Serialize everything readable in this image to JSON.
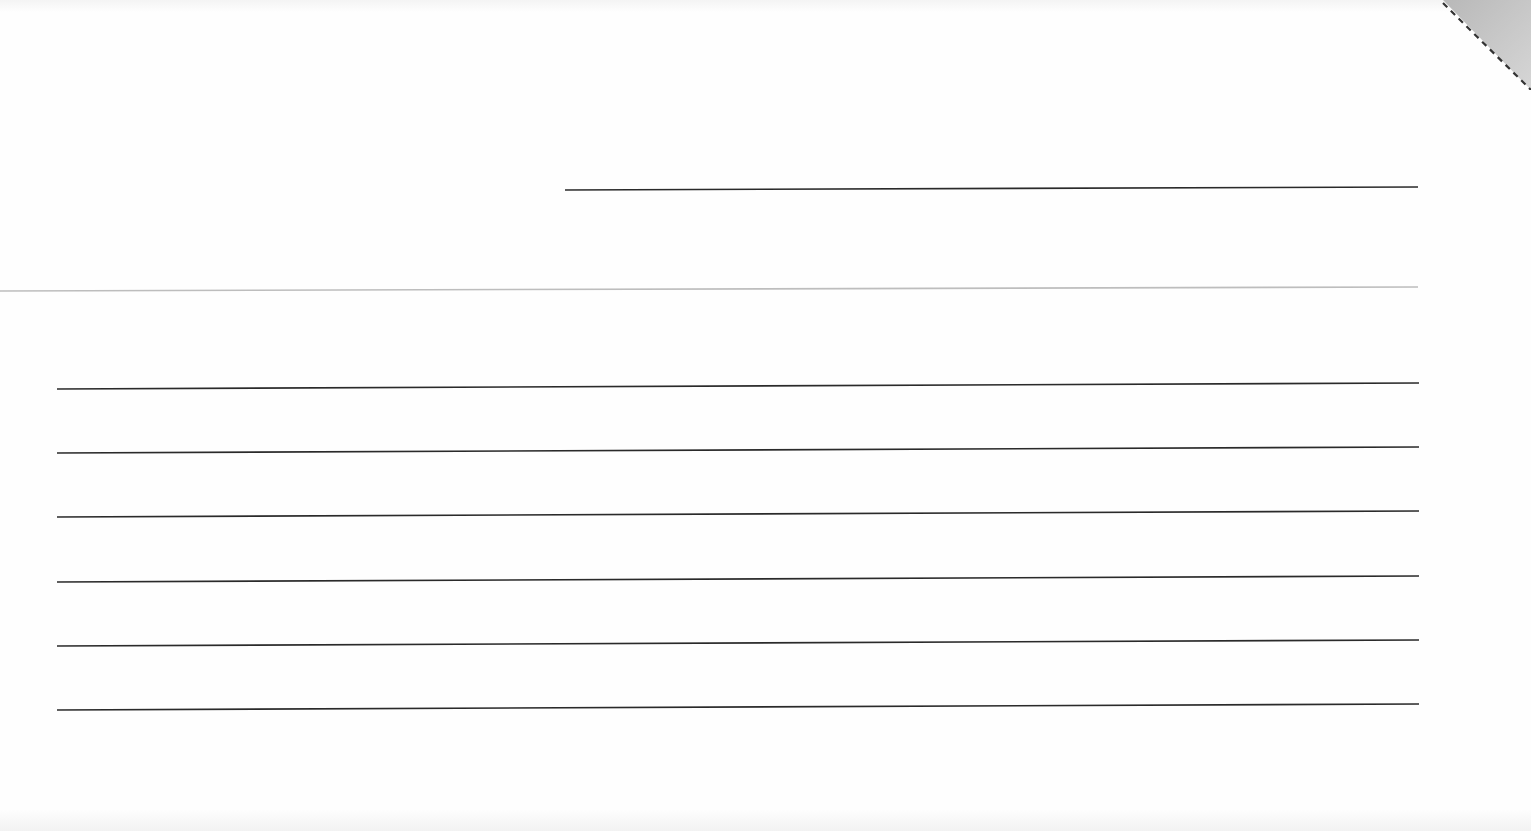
{
  "document": {
    "type": "blank ruled form",
    "background_color": "#fefefe",
    "line_color": "#2a2a2a",
    "separator_color": "#bdbdbd",
    "corner_fold_color": "#c4c4c4"
  },
  "lines": {
    "top_line": {
      "x1": 565,
      "y1": 190,
      "x2": 1418,
      "y2": 187
    },
    "separator": {
      "x1": 0,
      "y1": 291,
      "x2": 1418,
      "y2": 287
    },
    "ruled": [
      {
        "x1": 57,
        "y1": 389,
        "x2": 1419,
        "y2": 383
      },
      {
        "x1": 57,
        "y1": 453,
        "x2": 1419,
        "y2": 447
      },
      {
        "x1": 57,
        "y1": 517,
        "x2": 1419,
        "y2": 511
      },
      {
        "x1": 57,
        "y1": 582,
        "x2": 1419,
        "y2": 576
      },
      {
        "x1": 57,
        "y1": 646,
        "x2": 1419,
        "y2": 640
      },
      {
        "x1": 57,
        "y1": 710,
        "x2": 1419,
        "y2": 704
      }
    ]
  }
}
